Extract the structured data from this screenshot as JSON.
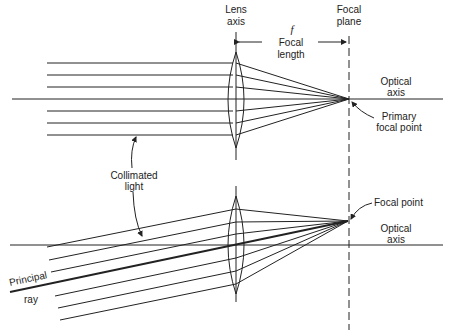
{
  "labels": {
    "lens_axis_1": "Lens",
    "lens_axis_2": "axis",
    "focal_plane_1": "Focal",
    "focal_plane_2": "plane",
    "f_symbol": "f",
    "focal_length_1": "Focal",
    "focal_length_2": "length",
    "optical_axis_top_1": "Optical",
    "optical_axis_top_2": "axis",
    "primary_fp_1": "Primary",
    "primary_fp_2": "focal point",
    "collimated_1": "Collimated",
    "collimated_2": "light",
    "focal_point": "Focal point",
    "optical_axis_bottom_1": "Optical",
    "optical_axis_bottom_2": "axis",
    "principal_1": "Principal",
    "principal_2": "ray"
  },
  "colors": {
    "ink": "#222222",
    "background": "#ffffff"
  }
}
